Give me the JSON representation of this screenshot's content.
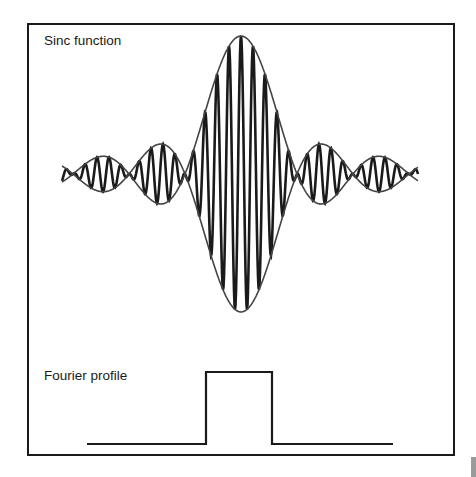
{
  "labels": {
    "sinc": "Sinc function",
    "fourier": "Fourier profile"
  },
  "colors": {
    "ink": "#1a1a1a",
    "envelope": "#444444",
    "background": "#ffffff",
    "corner_block": "#9a9a9a"
  },
  "sinc_wave": {
    "center_x": 241,
    "center_y": 174,
    "amplitude": 138,
    "zero_spacing": 56,
    "x_start": 62,
    "x_end": 418,
    "carrier_period": 12
  },
  "fourier_profile": {
    "baseline_y": 444,
    "top_y": 372,
    "x_start": 87,
    "rect_left": 206,
    "rect_right": 272,
    "x_end": 393
  },
  "chart_data": {
    "type": "line",
    "series": [
      {
        "name": "Sinc function",
        "description": "Carrier modulated by sinc envelope; main lobe with two side lobes each side",
        "zero_crossings_px": [
          125,
          185,
          297,
          355
        ]
      },
      {
        "name": "Fourier profile",
        "description": "Rectangular (top-hat) function",
        "x": [
          87,
          206,
          206,
          272,
          272,
          393
        ],
        "y": [
          0,
          0,
          1,
          1,
          0,
          0
        ]
      }
    ],
    "xlabel": "",
    "ylabel": "",
    "grid": false
  }
}
